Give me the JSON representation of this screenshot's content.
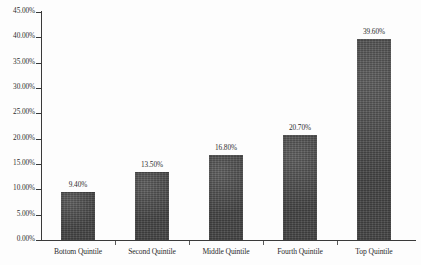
{
  "chart_data": {
    "type": "bar",
    "title": "",
    "subtitle": "",
    "xlabel": "",
    "ylabel": "",
    "categories": [
      "Bottom Quintile",
      "Second Quintile",
      "Middle Quintile",
      "Fourth Quintile",
      "Top Quintile"
    ],
    "values": [
      9.4,
      13.5,
      16.8,
      20.7,
      39.6
    ],
    "data_labels": [
      "9.40%",
      "13.50%",
      "16.80%",
      "20.70%",
      "39.60%"
    ],
    "ylim": [
      0,
      45
    ],
    "y_tick_values": [
      0,
      5,
      10,
      15,
      20,
      25,
      30,
      35,
      40,
      45
    ],
    "y_tick_labels": [
      "0.00%",
      "5.00%",
      "10.00%",
      "15.00%",
      "20.00%",
      "25.00%",
      "30.00%",
      "35.00%",
      "40.00%",
      "45.00%"
    ],
    "grid": false,
    "legend": false,
    "legend_position": "none",
    "bar_color": "#4b4b4b",
    "axis_color": "#3a3a3a",
    "background_color": "#fdfdfd",
    "text_color": "#2d2d2d"
  }
}
